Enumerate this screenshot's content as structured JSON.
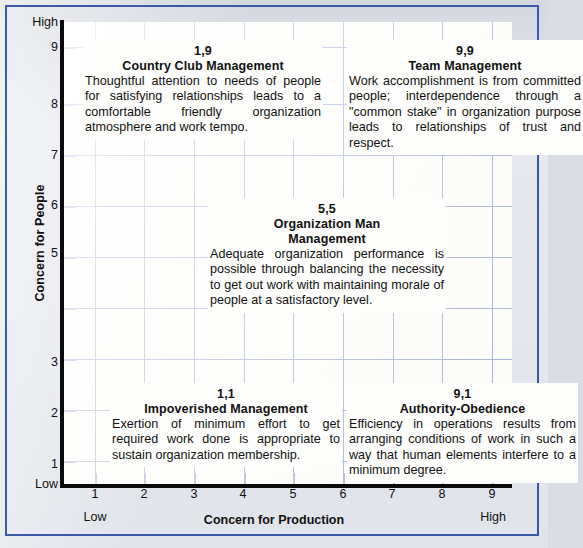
{
  "figure": {
    "type": "managerial-grid",
    "background_color": "#e2e5ea",
    "frame_color": "#3a5aa8",
    "grid_color": "#4a63ad",
    "axis_color": "#0b0b0b",
    "plot_background": "#fdfdfb"
  },
  "axes": {
    "x": {
      "title": "Concern for Production",
      "ticks": [
        "1",
        "2",
        "3",
        "4",
        "5",
        "6",
        "7",
        "8",
        "9"
      ],
      "low_label": "Low",
      "high_label": "High",
      "range": [
        0.5,
        9.5
      ]
    },
    "y": {
      "title": "Concern for People",
      "ticks": [
        "9",
        "8",
        "7",
        "6",
        "5",
        "",
        "3",
        "2",
        "1"
      ],
      "visible_ticks": [
        "9",
        "8",
        "7",
        "6",
        "5",
        "3",
        "2",
        "1"
      ],
      "low_label": "Low",
      "high_label": "High",
      "range": [
        0.5,
        9.5
      ]
    }
  },
  "chart_data": {
    "type": "scatter",
    "title": "",
    "xlabel": "Concern for Production",
    "ylabel": "Concern for People",
    "xlim": [
      0.5,
      9.5
    ],
    "ylim": [
      0.5,
      9.5
    ],
    "grid": true,
    "legend": "none",
    "categories": [
      "1,9",
      "9,9",
      "5,5",
      "1,1",
      "9,1"
    ],
    "x": [
      1,
      9,
      5,
      1,
      9
    ],
    "y": [
      9,
      9,
      5,
      1,
      1
    ],
    "labels": [
      "Country Club Management",
      "Team Management",
      "Organization Man Management",
      "Impoverished Management",
      "Authority-Obedience"
    ]
  },
  "cells": {
    "country_club": {
      "code": "1,9",
      "name": "Country Club Management",
      "body": "Thoughtful attention to needs of people for satisfying relationships leads to a comfortable friendly organization atmosphere and work tempo."
    },
    "team": {
      "code": "9,9",
      "name": "Team Management",
      "body": "Work accomplishment is from committed people; interdependence through a \"common stake\" in organization purpose leads to relationships of trust and respect."
    },
    "organization_man": {
      "code": "5,5",
      "name_line1": "Organization Man",
      "name_line2": "Management",
      "name": "Organization Man Management",
      "body": "Adequate organization performance is possible through balancing the necessity to get out work with maintaining morale of people at a satisfactory level."
    },
    "impoverished": {
      "code": "1,1",
      "name": "Impoverished Management",
      "body": "Exertion of minimum effort to get required work done is appropriate to sustain organization membership."
    },
    "authority_obedience": {
      "code": "9,1",
      "name": "Authority-Obedience",
      "body": "Efficiency in operations results from arranging conditions of work in such a way that human elements interfere to a minimum degree."
    }
  }
}
